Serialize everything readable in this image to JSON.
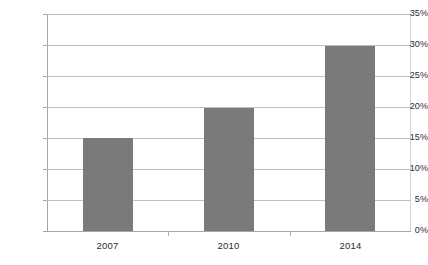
{
  "chart_data": {
    "type": "bar",
    "title": "",
    "subtitle": "",
    "xlabel": "",
    "ylabel": "",
    "categories": [
      "2007",
      "2010",
      "2014"
    ],
    "values": [
      15.0,
      19.8,
      29.8
    ],
    "value_labels": [
      "15%",
      "19.8%",
      "29.8%"
    ],
    "series": [
      {
        "name": "",
        "values": [
          15.0,
          19.8,
          29.8
        ],
        "color": "#7a7a7a"
      }
    ],
    "ylim": [
      0,
      35
    ],
    "ytick_step": 5,
    "ytick_labels": [
      "0%",
      "5%",
      "10%",
      "15%",
      "20%",
      "25%",
      "30%",
      "35%"
    ],
    "ytick_values": [
      0,
      5,
      10,
      15,
      20,
      25,
      30,
      35
    ],
    "grid": true,
    "grid_axis": "y",
    "legend": false,
    "legend_position": "none",
    "annotations": []
  },
  "style": {
    "bar_color": "#7a7a7a",
    "gridline_color": "#bfbfbf",
    "axis_color": "#a6a6a6",
    "text_color": "#2b2b2b",
    "background": "#ffffff"
  }
}
